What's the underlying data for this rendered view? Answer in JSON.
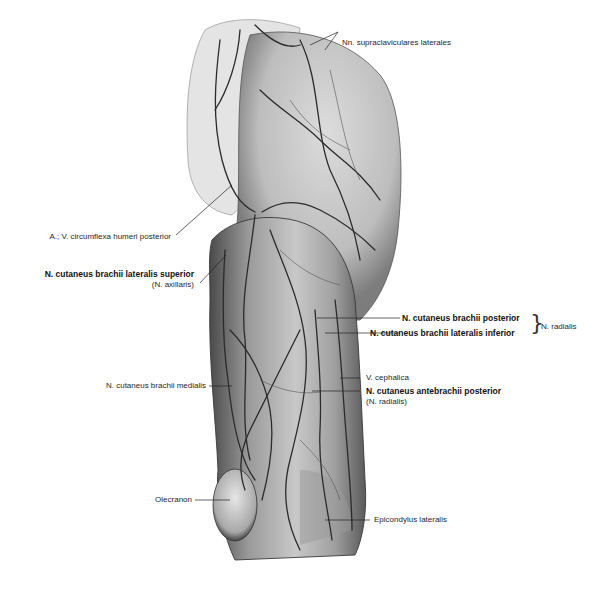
{
  "figure": {
    "labels": {
      "supraclaviculares": "Nn. supraclaviculares laterales",
      "circumflexa": "A.; V. circumflexa humeri posterior",
      "lat_superior": "N. cutaneus brachii lateralis superior",
      "lat_superior_sub": "(N. axillaris)",
      "brachii_posterior": "N. cutaneus brachii posterior",
      "lat_inferior": "N. cutaneus brachii lateralis inferior",
      "radialis_group": "N. radialis",
      "medialis": "N. cutaneus brachii medialis",
      "cephalica": "V. cephalica",
      "antebrachii_posterior": "N. cutaneus antebrachii posterior",
      "antebrachii_sub": "(N. radialis)",
      "olecranon": "Olecranon",
      "epicondylus": "Epicondylus lateralis"
    },
    "colors": {
      "skin_light": "#e8e8e8",
      "skin_mid": "#a9a9a9",
      "skin_dark": "#5a5a5a",
      "vessel": "#2b2b2b",
      "leader": "#222222"
    }
  }
}
